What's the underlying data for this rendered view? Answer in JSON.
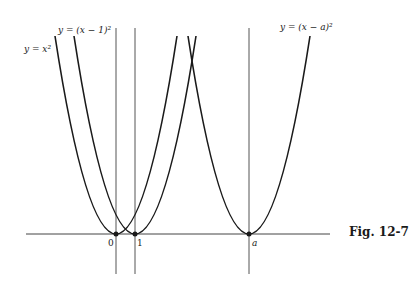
{
  "figure": {
    "caption": "Fig. 12-7",
    "curves": [
      {
        "label": "y = x²",
        "vertex": "0"
      },
      {
        "label": "y = (x − 1)²",
        "vertex": "1"
      },
      {
        "label": "y = (x − a)²",
        "vertex": "a"
      }
    ],
    "x_ticks": [
      "0",
      "1",
      "a"
    ]
  }
}
